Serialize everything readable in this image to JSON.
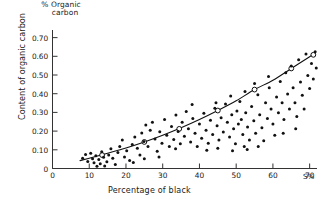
{
  "chart_data": {
    "type": "scatter",
    "title": "% Organic carbon",
    "title_lines": [
      "% Organic",
      "carbon"
    ],
    "xlabel": "Percentage of black",
    "ylabel": "Content of organic carbon",
    "x_unit": "S%",
    "xlim": [
      0,
      72
    ],
    "ylim": [
      0,
      0.73
    ],
    "grid": false,
    "legend": "none",
    "xticks": [
      0,
      10,
      20,
      30,
      40,
      50,
      60,
      70
    ],
    "xtick_labels": [
      "0",
      "10",
      "20",
      "30",
      "40",
      "50",
      "60",
      "70"
    ],
    "yticks": [
      0,
      0.1,
      0.2,
      0.3,
      0.4,
      0.5,
      0.6,
      0.7
    ],
    "ytick_labels": [
      "0",
      "0.10",
      "0.20",
      "0.30",
      "0.40",
      "0.50",
      "0.60",
      "0.70"
    ],
    "marker": "filled-dot",
    "marker_color": "#111111",
    "fit_curve_color": "#111111",
    "fit_marker": "open-circle",
    "series": [
      {
        "name": "observations",
        "points": [
          [
            8.2,
            0.055
          ],
          [
            9.0,
            0.075
          ],
          [
            9.6,
            0.038
          ],
          [
            10.4,
            0.082
          ],
          [
            10.9,
            0.052
          ],
          [
            11.3,
            0.031
          ],
          [
            11.8,
            0.068
          ],
          [
            12.1,
            0.012
          ],
          [
            12.6,
            0.048
          ],
          [
            13.0,
            0.025
          ],
          [
            13.4,
            0.09
          ],
          [
            13.9,
            0.06
          ],
          [
            14.2,
            0.014
          ],
          [
            14.8,
            0.036
          ],
          [
            15.3,
            0.072
          ],
          [
            15.9,
            0.105
          ],
          [
            16.4,
            0.055
          ],
          [
            17.1,
            0.021
          ],
          [
            17.8,
            0.086
          ],
          [
            18.3,
            0.118
          ],
          [
            19.0,
            0.152
          ],
          [
            19.6,
            0.062
          ],
          [
            20.2,
            0.095
          ],
          [
            21.0,
            0.043
          ],
          [
            21.7,
            0.128
          ],
          [
            22.4,
            0.168
          ],
          [
            23.1,
            0.108
          ],
          [
            23.8,
            0.072
          ],
          [
            24.3,
            0.19
          ],
          [
            24.9,
            0.145
          ],
          [
            25.4,
            0.232
          ],
          [
            26.0,
            0.118
          ],
          [
            26.6,
            0.205
          ],
          [
            27.2,
            0.248
          ],
          [
            27.9,
            0.158
          ],
          [
            28.5,
            0.092
          ],
          [
            29.2,
            0.196
          ],
          [
            29.8,
            0.135
          ],
          [
            30.5,
            0.262
          ],
          [
            31.1,
            0.178
          ],
          [
            31.8,
            0.118
          ],
          [
            32.4,
            0.225
          ],
          [
            33.0,
            0.155
          ],
          [
            33.6,
            0.286
          ],
          [
            34.2,
            0.198
          ],
          [
            34.8,
            0.132
          ],
          [
            35.3,
            0.248
          ],
          [
            35.9,
            0.172
          ],
          [
            36.4,
            0.305
          ],
          [
            37.0,
            0.212
          ],
          [
            37.6,
            0.142
          ],
          [
            38.2,
            0.268
          ],
          [
            38.8,
            0.188
          ],
          [
            39.4,
            0.118
          ],
          [
            40.0,
            0.238
          ],
          [
            40.6,
            0.162
          ],
          [
            41.2,
            0.295
          ],
          [
            41.8,
            0.205
          ],
          [
            42.4,
            0.135
          ],
          [
            43.0,
            0.258
          ],
          [
            43.6,
            0.182
          ],
          [
            44.2,
            0.322
          ],
          [
            44.8,
            0.228
          ],
          [
            45.3,
            0.152
          ],
          [
            45.9,
            0.272
          ],
          [
            46.5,
            0.195
          ],
          [
            47.1,
            0.345
          ],
          [
            47.6,
            0.248
          ],
          [
            48.2,
            0.168
          ],
          [
            48.8,
            0.288
          ],
          [
            49.3,
            0.212
          ],
          [
            49.8,
            0.132
          ],
          [
            50.2,
            0.308
          ],
          [
            50.6,
            0.238
          ],
          [
            51.0,
            0.358
          ],
          [
            51.4,
            0.262
          ],
          [
            51.8,
            0.182
          ],
          [
            52.2,
            0.118
          ],
          [
            52.6,
            0.298
          ],
          [
            53.1,
            0.222
          ],
          [
            53.6,
            0.152
          ],
          [
            54.2,
            0.332
          ],
          [
            54.8,
            0.255
          ],
          [
            55.3,
            0.188
          ],
          [
            55.9,
            0.395
          ],
          [
            56.4,
            0.288
          ],
          [
            57.0,
            0.218
          ],
          [
            57.5,
            0.148
          ],
          [
            58.0,
            0.352
          ],
          [
            58.5,
            0.268
          ],
          [
            59.0,
            0.432
          ],
          [
            59.5,
            0.318
          ],
          [
            60.0,
            0.238
          ],
          [
            60.5,
            0.178
          ],
          [
            61.0,
            0.382
          ],
          [
            61.5,
            0.298
          ],
          [
            62.0,
            0.465
          ],
          [
            62.5,
            0.352
          ],
          [
            63.0,
            0.262
          ],
          [
            63.5,
            0.512
          ],
          [
            64.0,
            0.398
          ],
          [
            64.5,
            0.318
          ],
          [
            65.0,
            0.548
          ],
          [
            65.5,
            0.432
          ],
          [
            66.0,
            0.352
          ],
          [
            66.5,
            0.278
          ],
          [
            67.0,
            0.582
          ],
          [
            67.5,
            0.462
          ],
          [
            68.0,
            0.392
          ],
          [
            68.5,
            0.318
          ],
          [
            69.0,
            0.612
          ],
          [
            69.5,
            0.498
          ],
          [
            70.0,
            0.428
          ],
          [
            70.5,
            0.562
          ],
          [
            71.0,
            0.478
          ],
          [
            71.5,
            0.625
          ],
          [
            71.8,
            0.538
          ],
          [
            56.0,
            0.118
          ],
          [
            53.0,
            0.102
          ],
          [
            49.0,
            0.095
          ],
          [
            45.0,
            0.108
          ],
          [
            42.0,
            0.098
          ],
          [
            55.0,
            0.455
          ],
          [
            58.8,
            0.492
          ],
          [
            62.8,
            0.188
          ],
          [
            66.2,
            0.212
          ],
          [
            52.4,
            0.412
          ],
          [
            48.5,
            0.388
          ],
          [
            44.5,
            0.352
          ],
          [
            38.0,
            0.342
          ],
          [
            33.5,
            0.105
          ],
          [
            29.0,
            0.062
          ],
          [
            25.0,
            0.052
          ],
          [
            22.0,
            0.032
          ]
        ]
      }
    ],
    "fit_curve": {
      "name": "fitted trend",
      "points": [
        [
          7.5,
          0.042
        ],
        [
          10,
          0.055
        ],
        [
          15,
          0.082
        ],
        [
          20,
          0.11
        ],
        [
          25,
          0.142
        ],
        [
          30,
          0.178
        ],
        [
          35,
          0.218
        ],
        [
          40,
          0.262
        ],
        [
          45,
          0.31
        ],
        [
          50,
          0.362
        ],
        [
          55,
          0.422
        ],
        [
          60,
          0.472
        ],
        [
          65,
          0.535
        ],
        [
          70,
          0.598
        ],
        [
          71.5,
          0.618
        ]
      ],
      "marker_points": [
        [
          13.5,
          0.072
        ],
        [
          25.0,
          0.142
        ],
        [
          34.5,
          0.212
        ],
        [
          45.0,
          0.31
        ],
        [
          55.0,
          0.422
        ],
        [
          65.0,
          0.535
        ],
        [
          71.0,
          0.608
        ]
      ]
    }
  }
}
